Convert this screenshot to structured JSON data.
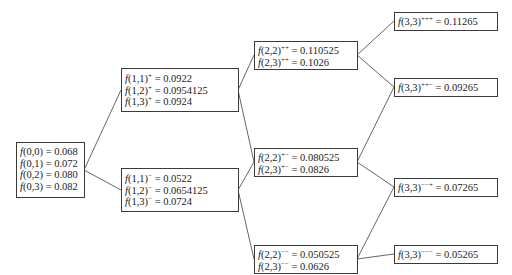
{
  "diagram": {
    "type": "binomial-tree",
    "nodes": {
      "n0": {
        "lines": [
          {
            "fn": "f",
            "args": "(0,0)",
            "sup": "",
            "value": "= 0.068"
          },
          {
            "fn": "f",
            "args": "(0,1)",
            "sup": "",
            "value": "= 0.072"
          },
          {
            "fn": "f",
            "args": "(0,2)",
            "sup": "",
            "value": "= 0.080"
          },
          {
            "fn": "f",
            "args": "(0,3)",
            "sup": "",
            "value": "= 0.082"
          }
        ]
      },
      "n1u": {
        "lines": [
          {
            "fn": "f",
            "args": "(1,1)",
            "sup": "+",
            "value": " = 0.0922"
          },
          {
            "fn": "f",
            "args": "(1,2)",
            "sup": "+",
            "value": " = 0.0954125"
          },
          {
            "fn": "f",
            "args": "(1,3)",
            "sup": "+",
            "value": " = 0.0924"
          }
        ]
      },
      "n1d": {
        "lines": [
          {
            "fn": "f",
            "args": "(1,1)",
            "sup": "−",
            "value": " = 0.0522"
          },
          {
            "fn": "f",
            "args": "(1,2)",
            "sup": "−",
            "value": " = 0.0654125"
          },
          {
            "fn": "f",
            "args": "(1,3)",
            "sup": "−",
            "value": " = 0.0724"
          }
        ]
      },
      "n2uu": {
        "lines": [
          {
            "fn": "f",
            "args": "(2,2)",
            "sup": "++",
            "value": " = 0.110525"
          },
          {
            "fn": "f",
            "args": "(2,3)",
            "sup": "++",
            "value": " = 0.1026"
          }
        ]
      },
      "n2ud": {
        "lines": [
          {
            "fn": "f",
            "args": "(2,2)",
            "sup": "+−",
            "value": " = 0.080525"
          },
          {
            "fn": "f",
            "args": "(2,3)",
            "sup": "+−",
            "value": " = 0.0826"
          }
        ]
      },
      "n2dd": {
        "lines": [
          {
            "fn": "f",
            "args": "(2,2)",
            "sup": "−−",
            "value": " = 0.050525"
          },
          {
            "fn": "f",
            "args": "(2,3)",
            "sup": "−−",
            "value": " = 0.0626"
          }
        ]
      },
      "n3uuu": {
        "lines": [
          {
            "fn": "f",
            "args": "(3,3)",
            "sup": "+++",
            "value": " = 0.11265"
          }
        ]
      },
      "n3uud": {
        "lines": [
          {
            "fn": "f",
            "args": "(3,3)",
            "sup": "++−",
            "value": " = 0.09265"
          }
        ]
      },
      "n3ddu": {
        "lines": [
          {
            "fn": "f",
            "args": "(3,3)",
            "sup": "−−+",
            "value": " = 0.07265"
          }
        ]
      },
      "n3ddd": {
        "lines": [
          {
            "fn": "f",
            "args": "(3,3)",
            "sup": "−−−",
            "value": " = 0.05265"
          }
        ]
      }
    },
    "edges": [
      [
        "n0",
        "n1u"
      ],
      [
        "n0",
        "n1d"
      ],
      [
        "n1u",
        "n2uu"
      ],
      [
        "n1u",
        "n2ud"
      ],
      [
        "n1d",
        "n2ud"
      ],
      [
        "n1d",
        "n2dd"
      ],
      [
        "n2uu",
        "n3uuu"
      ],
      [
        "n2uu",
        "n3uud"
      ],
      [
        "n2ud",
        "n3uud"
      ],
      [
        "n2ud",
        "n3ddu"
      ],
      [
        "n2dd",
        "n3ddu"
      ],
      [
        "n2dd",
        "n3ddd"
      ]
    ],
    "colors": {
      "line": "#555555",
      "border": "#3a3a3a",
      "text": "#1a1a1a"
    }
  }
}
